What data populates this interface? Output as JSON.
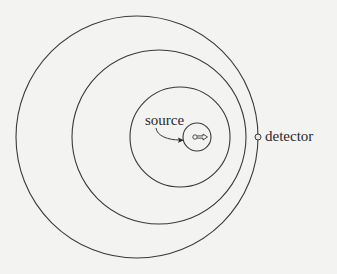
{
  "diagram": {
    "type": "concentric-wavefronts",
    "labels": {
      "source": "source",
      "detector": "detector"
    },
    "colors": {
      "background": "#f3f3f1",
      "stroke": "#3a3a3a"
    },
    "circles": [
      {
        "name": "outer-wavefront",
        "cx": 137,
        "cy": 137,
        "r": 121
      },
      {
        "name": "second-wavefront",
        "cx": 159,
        "cy": 137,
        "r": 87
      },
      {
        "name": "third-wavefront",
        "cx": 180,
        "cy": 137,
        "r": 50
      },
      {
        "name": "source-circle",
        "cx": 197,
        "cy": 137,
        "r": 14
      }
    ],
    "source_glyph": "moving source with rightward arrow",
    "detector_point": {
      "x": 258,
      "y": 137
    }
  }
}
